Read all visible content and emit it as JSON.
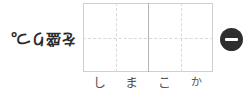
{
  "prompt": {
    "text": "を盛りつ。",
    "orientation": "rotated-180"
  },
  "grid": {
    "cell_count": 4,
    "rows": 1,
    "columns": 4,
    "center_divider": "solid",
    "guideline_style": "dashed",
    "border_color": "#cfcfcf",
    "divider_color": "#b4b4b4",
    "guideline_color": "#d8d8d8"
  },
  "answer": {
    "cells": [
      {
        "char": "し"
      },
      {
        "char": "ま"
      },
      {
        "char": "こ"
      },
      {
        "char": "か"
      }
    ]
  },
  "remove_button": {
    "label": "−",
    "color": "#2e2e2e",
    "icon": "minus-icon"
  }
}
